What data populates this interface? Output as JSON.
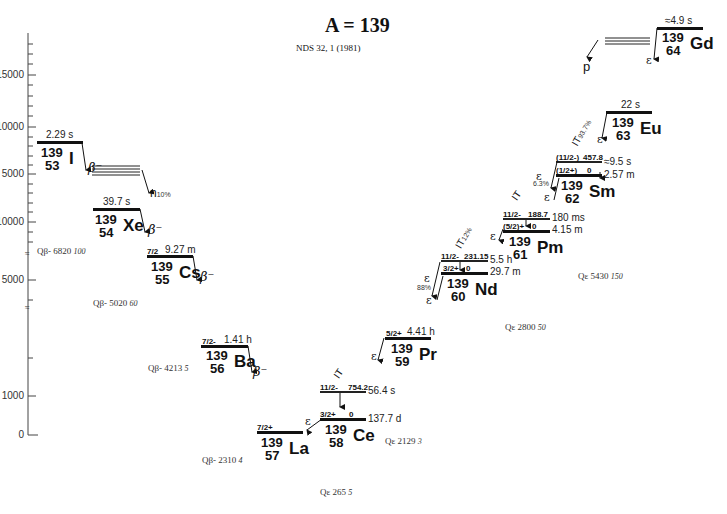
{
  "header": {
    "title": "A = 139",
    "reference": "NDS 32, 1 (1981)"
  },
  "axis": {
    "ticks": [
      "15000",
      "10000",
      "5000",
      "10000",
      "5000",
      "1000",
      "0"
    ]
  },
  "nuclides": [
    {
      "id": "I",
      "mass": "139",
      "z": "53",
      "symbol": "I",
      "half_life": "2.29 s",
      "spin": "",
      "decay": "β⁻",
      "q_label": "Qβ-",
      "q_value": "6820",
      "q_unc": "100"
    },
    {
      "id": "Xe",
      "mass": "139",
      "z": "54",
      "symbol": "Xe",
      "half_life": "39.7 s",
      "spin": "",
      "decay": "β⁻",
      "q_label": "Qβ-",
      "q_value": "5020",
      "q_unc": "60"
    },
    {
      "id": "Cs",
      "mass": "139",
      "z": "55",
      "symbol": "Cs",
      "half_life": "9.27 m",
      "spin": "7/2",
      "decay": "β⁻",
      "q_label": "Qβ-",
      "q_value": "4213",
      "q_unc": "5"
    },
    {
      "id": "Ba",
      "mass": "139",
      "z": "56",
      "symbol": "Ba",
      "half_life": "1.41 h",
      "spin": "7/2-",
      "decay": "β⁻",
      "q_label": "Qβ-",
      "q_value": "2310",
      "q_unc": "4"
    },
    {
      "id": "La",
      "mass": "139",
      "z": "57",
      "symbol": "La",
      "half_life": "",
      "spin": "7/2+",
      "decay": ""
    },
    {
      "id": "Ce",
      "mass": "139",
      "z": "58",
      "symbol": "Ce",
      "half_life": "137.7 d",
      "spin": "3/2+",
      "energy": "0",
      "decay": "ε",
      "q_label": "Qε",
      "q_value": "265",
      "q_unc": "5",
      "isomer": {
        "spin": "11/2-",
        "energy": "754.2",
        "half_life": "56.4 s",
        "decay": "IT"
      }
    },
    {
      "id": "Pr",
      "mass": "139",
      "z": "59",
      "symbol": "Pr",
      "half_life": "4.41 h",
      "spin": "5/2+",
      "decay": "ε",
      "q_label": "Qε",
      "q_value": "2129",
      "q_unc": "3"
    },
    {
      "id": "Nd",
      "mass": "139",
      "z": "60",
      "symbol": "Nd",
      "half_life": "29.7 m",
      "spin": "3/2+",
      "energy": "0",
      "decay": "ε",
      "branch": "88%",
      "q_label": "Qε",
      "q_value": "2800",
      "q_unc": "50",
      "isomer": {
        "spin": "11/2-",
        "energy": "231.15",
        "half_life": "5.5 h",
        "decay": "IT",
        "branch": "12%"
      }
    },
    {
      "id": "Pm",
      "mass": "139",
      "z": "61",
      "symbol": "Pm",
      "half_life": "4.15 m",
      "spin": "(5/2)+",
      "energy": "0",
      "decay": "ε",
      "q_label": "Qε",
      "q_value": "4520",
      "q_unc": "40",
      "isomer": {
        "spin": "11/2-",
        "energy": "188.7",
        "half_life": "180 ms",
        "decay": "IT"
      }
    },
    {
      "id": "Sm",
      "mass": "139",
      "z": "62",
      "symbol": "Sm",
      "half_life": "2.57 m",
      "spin": "(1/2+)",
      "energy": "0",
      "decay": "ε",
      "q_label": "Qε",
      "q_value": "5430",
      "q_unc": "150",
      "isomer": {
        "spin": "(11/2-)",
        "energy": "457.8",
        "half_life": "≈9.5 s",
        "decay": "IT",
        "branch": "93.7%",
        "eps_branch": "6.3%"
      }
    },
    {
      "id": "Eu",
      "mass": "139",
      "z": "63",
      "symbol": "Eu",
      "half_life": "22 s",
      "spin": "",
      "decay": "ε"
    },
    {
      "id": "Gd",
      "mass": "139",
      "z": "64",
      "symbol": "Gd",
      "half_life": "≈4.9 s",
      "spin": "",
      "decay": "ε"
    }
  ],
  "labels": {
    "beta_minus": "β⁻",
    "epsilon": "ε",
    "it": "IT",
    "neutron": "n",
    "neutron_branch": "10%",
    "proton": "p"
  }
}
